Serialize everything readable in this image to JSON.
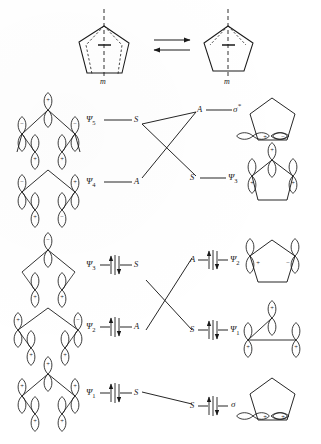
{
  "figure": {
    "type": "orbital-correlation-diagram",
    "top_scheme": {
      "left_structure_name": "open-envelope-cyclopentadiene",
      "right_structure_name": "closed-pentagon-cyclopentadiene",
      "mirror_label_left": "m",
      "mirror_label_right": "m",
      "arrow_symbol": "equilibrium-double-arrow"
    },
    "upper_correlation": {
      "rows": [
        {
          "left_orbital": "Ψ",
          "left_sub": "5",
          "left_symmetry": "S",
          "right_symmetry": "A",
          "right_orbital": "σ",
          "right_sup": "*",
          "electrons": "",
          "left_structure": "open-pentadienyl-psi5",
          "right_structure": "pentagon-sigma-star"
        },
        {
          "left_orbital": "Ψ",
          "left_sub": "4",
          "left_symmetry": "A",
          "right_symmetry": "S",
          "right_orbital": "Ψ",
          "right_sup": "",
          "right_sub": "3",
          "electrons": "",
          "left_structure": "open-pentadienyl-psi4",
          "right_structure": "pentagon-psi3"
        }
      ]
    },
    "lower_correlation": {
      "rows": [
        {
          "left_orbital": "Ψ",
          "left_sub": "3",
          "left_symmetry": "S",
          "right_symmetry": "A",
          "right_orbital": "Ψ",
          "right_sub": "2",
          "electrons": "↑↓",
          "left_structure": "open-pentadienyl-psi3",
          "right_structure": "pentagon-psi2"
        },
        {
          "left_orbital": "Ψ",
          "left_sub": "2",
          "left_symmetry": "A",
          "right_symmetry": "S",
          "right_orbital": "Ψ",
          "right_sub": "1",
          "electrons": "↑↓",
          "left_structure": "open-pentadienyl-psi2",
          "right_structure": "pentagon-psi1"
        }
      ]
    },
    "bottom_row": {
      "left_orbital": "Ψ",
      "left_sub": "1",
      "left_symmetry": "S",
      "right_symmetry": "S",
      "right_orbital": "σ",
      "electrons": "↑↓",
      "left_structure": "open-pentadienyl-psi1",
      "right_structure": "pentagon-sigma"
    },
    "orbital_signs": {
      "plus": "+",
      "minus": "−"
    },
    "colors": {
      "ink": "#1a1a1a",
      "paper": "#ffffff"
    }
  }
}
